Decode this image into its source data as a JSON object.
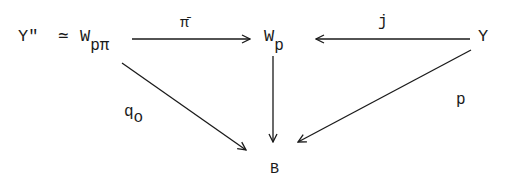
{
  "diagram": {
    "type": "commutative-diagram",
    "nodes": {
      "yprime": {
        "text": "Y\"",
        "x": 18,
        "y": 30
      },
      "simeq": {
        "text": "≃",
        "x": 60,
        "y": 30
      },
      "wppi": {
        "base": "W",
        "sub": "pπ",
        "x": 80,
        "y": 30
      },
      "wp": {
        "base": "W",
        "sub": "p",
        "x": 265,
        "y": 30
      },
      "y": {
        "text": "Y",
        "x": 477,
        "y": 30
      },
      "b": {
        "text": "B",
        "x": 270,
        "y": 160
      }
    },
    "edges": [
      {
        "from": "wppi",
        "to": "wp",
        "label": "π̄"
      },
      {
        "from": "y",
        "to": "wp",
        "label": "j"
      },
      {
        "from": "wp",
        "to": "b",
        "label": ""
      },
      {
        "from": "wppi",
        "to": "b",
        "label": "q",
        "label_sub": "o"
      },
      {
        "from": "y",
        "to": "b",
        "label": "p"
      }
    ],
    "labels": {
      "pibar": "π̄",
      "j": "j",
      "q": "q",
      "q_sub": "o",
      "p": "p"
    }
  }
}
